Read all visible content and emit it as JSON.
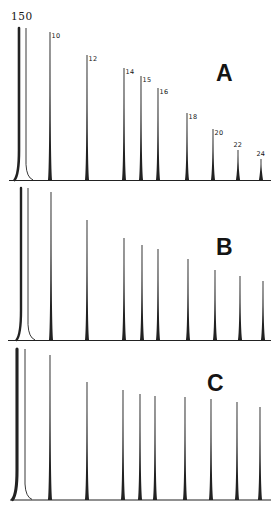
{
  "figure": {
    "attenuation_label": "150",
    "background_color": "#ffffff",
    "line_color": "#222222",
    "label_color": "#141414"
  },
  "chart_data": [
    {
      "type": "line",
      "subtype": "chromatogram",
      "panel_label": "A",
      "title": "",
      "xlabel": "",
      "ylabel": "",
      "grid": false,
      "peak_labels_visible": true,
      "baseline_y": 180.5,
      "baseline_x": [
        9,
        271
      ],
      "solvent_peak": {
        "x": 19,
        "tail_x": 26,
        "top_y": 28,
        "stroke_width": 2.6,
        "clipped_offscale": true
      },
      "peaks": [
        {
          "label": "10",
          "x": 50,
          "top_y": 32
        },
        {
          "label": "12",
          "x": 87,
          "top_y": 55
        },
        {
          "label": "14",
          "x": 124,
          "top_y": 68
        },
        {
          "label": "15",
          "x": 141,
          "top_y": 76
        },
        {
          "label": "16",
          "x": 158,
          "top_y": 88
        },
        {
          "label": "18",
          "x": 187,
          "top_y": 113
        },
        {
          "label": "20",
          "x": 213,
          "top_y": 129
        },
        {
          "label": "22",
          "x": 238,
          "top_y": 150,
          "label_above": true
        },
        {
          "label": "24",
          "x": 261,
          "top_y": 159,
          "label_above": true
        }
      ]
    },
    {
      "type": "line",
      "subtype": "chromatogram",
      "panel_label": "B",
      "title": "",
      "xlabel": "",
      "ylabel": "",
      "grid": false,
      "peak_labels_visible": false,
      "baseline_y": 340.5,
      "baseline_x": [
        8,
        271
      ],
      "solvent_peak": {
        "x": 21,
        "tail_x": 28,
        "top_y": 188,
        "stroke_width": 2.4,
        "clipped_offscale": true
      },
      "peaks": [
        {
          "label": "10",
          "x": 51,
          "top_y": 192
        },
        {
          "label": "12",
          "x": 87,
          "top_y": 220
        },
        {
          "label": "14",
          "x": 124,
          "top_y": 238
        },
        {
          "label": "15",
          "x": 142,
          "top_y": 245
        },
        {
          "label": "16",
          "x": 158,
          "top_y": 249
        },
        {
          "label": "18",
          "x": 188,
          "top_y": 259
        },
        {
          "label": "20",
          "x": 215,
          "top_y": 270
        },
        {
          "label": "22",
          "x": 240,
          "top_y": 276
        },
        {
          "label": "24",
          "x": 263,
          "top_y": 281
        }
      ]
    },
    {
      "type": "line",
      "subtype": "chromatogram",
      "panel_label": "C",
      "title": "",
      "xlabel": "",
      "ylabel": "",
      "grid": false,
      "peak_labels_visible": false,
      "baseline_y": 500,
      "baseline_x": [
        10,
        271
      ],
      "solvent_peak": {
        "x": 17,
        "tail_x": 25,
        "top_y": 349,
        "stroke_width": 3.1,
        "clipped_offscale": true
      },
      "peaks": [
        {
          "label": "10",
          "x": 50,
          "top_y": 355
        },
        {
          "label": "12",
          "x": 87,
          "top_y": 382
        },
        {
          "label": "14",
          "x": 123,
          "top_y": 390
        },
        {
          "label": "15",
          "x": 140,
          "top_y": 394
        },
        {
          "label": "16",
          "x": 155,
          "top_y": 396
        },
        {
          "label": "18",
          "x": 185,
          "top_y": 397
        },
        {
          "label": "20",
          "x": 211,
          "top_y": 399
        },
        {
          "label": "22",
          "x": 237,
          "top_y": 402
        },
        {
          "label": "24",
          "x": 260,
          "top_y": 407
        }
      ]
    }
  ]
}
